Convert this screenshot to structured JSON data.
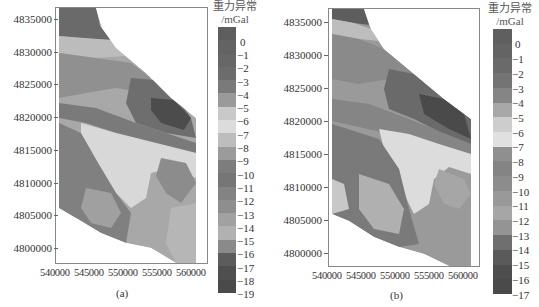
{
  "chart_data": [
    {
      "type": "heatmap",
      "subtype": "filled-contour-map",
      "panel": "(a)",
      "caption": "(a)",
      "colorbar_title": "重力异常",
      "colorbar_unit": "/mGal",
      "colorbar_levels": [
        0,
        -1,
        -2,
        -3,
        -4,
        -5,
        -6,
        -7,
        -8,
        -9,
        -10,
        -11,
        -12,
        -13,
        -14,
        -15,
        -16,
        -17,
        -18,
        -19
      ],
      "colorbar_colors": [
        "#5e5e5e",
        "#636363",
        "#676767",
        "#6c6c6c",
        "#7a7a7a",
        "#9a9a9a",
        "#c9c9c9",
        "#dcdcdc",
        "#bdbdbd",
        "#9b9b9b",
        "#7d7d7d",
        "#767676",
        "#838383",
        "#8e8e8e",
        "#a1a1a1",
        "#b1b1b1",
        "#8a8a8a",
        "#5c5c5c",
        "#4f4f4f",
        "#4a4a4a"
      ],
      "x_ticks": [
        "540000",
        "545000",
        "550000",
        "555000",
        "560000"
      ],
      "y_ticks": [
        "4835000",
        "4830000",
        "4825000",
        "4820000",
        "4815000",
        "4810000",
        "4805000",
        "4800000"
      ],
      "xlim": [
        540000,
        561000
      ],
      "ylim": [
        4797500,
        4836500
      ],
      "grid": false,
      "legend_position": "right"
    },
    {
      "type": "heatmap",
      "subtype": "filled-contour-map",
      "panel": "(b)",
      "caption": "(b)",
      "colorbar_title": "重力异常",
      "colorbar_unit": "/mGal",
      "colorbar_levels": [
        0,
        -1,
        -2,
        -3,
        -4,
        -5,
        -6,
        -7,
        -8,
        -9,
        -10,
        -11,
        -12,
        -13,
        -14,
        -15,
        -16,
        -17
      ],
      "colorbar_colors": [
        "#5f5f5f",
        "#646464",
        "#6a6a6a",
        "#747474",
        "#858585",
        "#a8a8a8",
        "#cdcdcd",
        "#e0e0e0",
        "#8f8f8f",
        "#848484",
        "#8c8c8c",
        "#999999",
        "#a6a6a6",
        "#949494",
        "#6f6f6f",
        "#5a5a5a",
        "#4e4e4e",
        "#4a4a4a"
      ],
      "x_ticks": [
        "540000",
        "545000",
        "550000",
        "555000",
        "560000"
      ],
      "y_ticks": [
        "4835000",
        "4830000",
        "4825000",
        "4820000",
        "4815000",
        "4810000",
        "4805000",
        "4800000"
      ],
      "xlim": [
        540000,
        561000
      ],
      "ylim": [
        4797500,
        4836500
      ],
      "grid": false,
      "legend_position": "right"
    }
  ]
}
